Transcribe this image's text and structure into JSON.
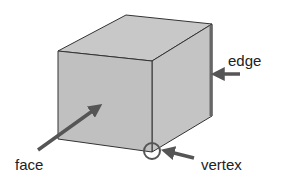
{
  "diagram": {
    "labels": {
      "edge": "edge",
      "face": "face",
      "vertex": "vertex"
    },
    "colors": {
      "face_fill": "#c0c0c0",
      "side_fill": "#c4c4c4",
      "top_fill": "#c8c8c8",
      "outline": "#333333",
      "arrow": "#555555",
      "edge_highlight": "#666666"
    }
  }
}
